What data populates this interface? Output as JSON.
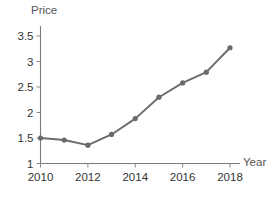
{
  "chart_data": {
    "type": "line",
    "title": "",
    "xlabel": "Year",
    "ylabel": "Price",
    "x": [
      2010,
      2011,
      2012,
      2013,
      2014,
      2015,
      2016,
      2017,
      2018
    ],
    "values": [
      1.5,
      1.46,
      1.36,
      1.57,
      1.88,
      2.3,
      2.58,
      2.79,
      3.27
    ],
    "series": [
      {
        "name": "Price",
        "values": [
          1.5,
          1.46,
          1.36,
          1.57,
          1.88,
          2.3,
          2.58,
          2.79,
          3.27
        ]
      }
    ],
    "xlim": [
      2010,
      2018
    ],
    "ylim": [
      1,
      3.5
    ],
    "xticks": [
      2010,
      2012,
      2014,
      2016,
      2018
    ],
    "xtick_labels": [
      "2010",
      "2012",
      "2014",
      "2016",
      "2018"
    ],
    "yticks": [
      1,
      1.5,
      2,
      2.5,
      3,
      3.5
    ],
    "ytick_labels": [
      "1",
      "1.5",
      "2",
      "2.5",
      "3",
      "3.5"
    ],
    "grid": false,
    "legend": false,
    "legend_position": "none",
    "marker": "circle",
    "line_color": "#6b6b6b",
    "marker_color": "#6b6b6b",
    "axis_color": "#7a7a7a",
    "background_color": "#ffffff",
    "annotations": []
  },
  "axis_titles": {
    "y": "Price",
    "x": "Year"
  }
}
